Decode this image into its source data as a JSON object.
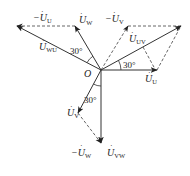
{
  "diagram": {
    "type": "phasor-diagram",
    "origin": {
      "label": "O",
      "x": 101,
      "y": 70
    },
    "phasors": {
      "U_U": {
        "label": "U",
        "sub": "U",
        "prefix": "",
        "tip": [
          157,
          70
        ]
      },
      "U_V": {
        "label": "U",
        "sub": "V",
        "prefix": "",
        "tip": [
          78,
          113
        ]
      },
      "U_W": {
        "label": "U",
        "sub": "W",
        "prefix": "",
        "tip": [
          75,
          26
        ]
      },
      "neg_U_U": {
        "label": "U",
        "sub": "U",
        "prefix": "−",
        "from": [
          75,
          26
        ],
        "tip": [
          17,
          26
        ]
      },
      "neg_U_V": {
        "label": "U",
        "sub": "V",
        "prefix": "−",
        "tip": [
          128,
          26
        ]
      },
      "neg_U_W": {
        "label": "U",
        "sub": "W",
        "prefix": "−",
        "from": [
          78,
          113
        ],
        "tip": [
          101,
          143
        ]
      },
      "U_UV": {
        "label": "U",
        "sub": "UV",
        "prefix": "",
        "tip": [
          181,
          26
        ]
      },
      "U_VW": {
        "label": "U",
        "sub": "VW",
        "prefix": "",
        "tip": [
          101,
          143
        ]
      },
      "U_WU": {
        "label": "U",
        "sub": "WU",
        "prefix": "",
        "tip": [
          17,
          26
        ]
      }
    },
    "angles": [
      {
        "label": "30°",
        "between": [
          "U_UV",
          "U_U"
        ]
      },
      {
        "label": "30°",
        "between": [
          "U_WU",
          "U_W"
        ]
      },
      {
        "label": "30°",
        "between": [
          "U_VW",
          "U_V"
        ]
      }
    ]
  }
}
